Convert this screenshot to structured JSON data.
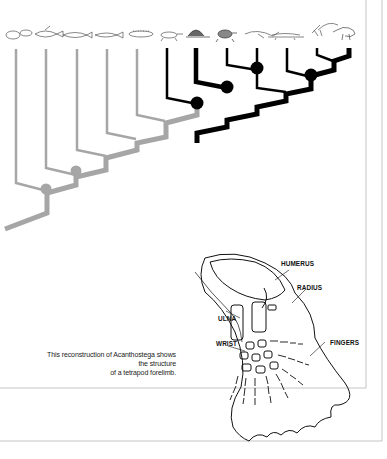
{
  "figure": {
    "type": "cladogram-with-illustration",
    "taxa_icons": [
      "lobe-fin-fish-1",
      "lobe-fin-fish-2",
      "lobe-fin-fish-3",
      "lobe-fin-fish-4",
      "lungfish",
      "early-tetrapod",
      "dimetrodon",
      "turtle",
      "ichthyosaur",
      "crocodile",
      "pterosaur",
      "dinosaur"
    ],
    "colors": {
      "gray_branch": "#a6a6a6",
      "black_branch": "#000000",
      "frame": "#bdbdbd"
    },
    "nodes_gray": 2,
    "nodes_black": 4
  },
  "forelimb": {
    "labels": {
      "humerus": "HUMERUS",
      "radius": "RADIUS",
      "ulna": "ULNA",
      "wrist": "WRIST",
      "fingers": "FINGERS"
    }
  },
  "caption": {
    "line1": "This reconstruction of Acanthostega shows",
    "line2": "the structure",
    "line3": "of a tetrapod forelimb."
  }
}
